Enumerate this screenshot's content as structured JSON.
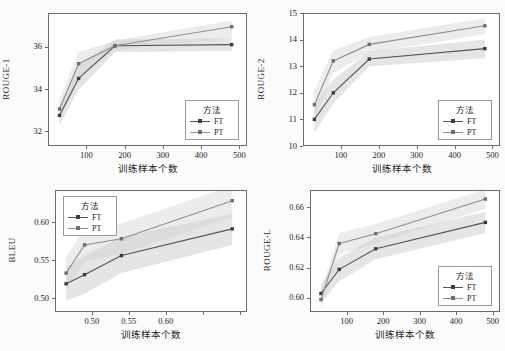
{
  "figure": {
    "background": "#fbfbfb",
    "line_color_ft": "#555555",
    "line_color_pt": "#8f8f8f",
    "band_color": "#cfcfcf",
    "axis_color": "#6b6b6b"
  },
  "legend": {
    "title": "方法",
    "entries": [
      {
        "label": "FT",
        "color": "#555555"
      },
      {
        "label": "PT",
        "color": "#8f8f8f"
      }
    ]
  },
  "chart_data": [
    {
      "id": "rouge1",
      "type": "line",
      "title": "",
      "xlabel": "训练样本个数",
      "ylabel": "ROUGE-1",
      "xlim": [
        0,
        520
      ],
      "ylim": [
        31.3,
        37.6
      ],
      "xticks": [
        100,
        200,
        300,
        400,
        500
      ],
      "yticks": [
        32,
        34,
        36
      ],
      "xticklabels": [
        "100",
        "200",
        "300",
        "400",
        "500"
      ],
      "yticklabels": [
        "32",
        "34",
        "36"
      ],
      "grid": false,
      "legend_position": "lower-right",
      "x": [
        30,
        80,
        175,
        480
      ],
      "series": [
        {
          "name": "FT",
          "values": [
            32.75,
            34.5,
            36.05,
            36.1
          ],
          "band_low": [
            32.3,
            33.95,
            35.75,
            35.8
          ],
          "band_high": [
            33.2,
            35.1,
            36.35,
            36.4
          ]
        },
        {
          "name": "PT",
          "values": [
            33.05,
            35.2,
            36.05,
            36.95
          ],
          "band_low": [
            32.5,
            34.6,
            35.85,
            36.4
          ],
          "band_high": [
            33.5,
            35.75,
            36.3,
            37.25
          ]
        }
      ]
    },
    {
      "id": "rouge2",
      "type": "line",
      "title": "",
      "xlabel": "训练样本个数",
      "ylabel": "ROUGE-2",
      "xlim": [
        0,
        520
      ],
      "ylim": [
        10,
        15
      ],
      "xticks": [
        100,
        200,
        300,
        400,
        500
      ],
      "yticks": [
        10,
        11,
        12,
        13,
        14,
        15
      ],
      "xticklabels": [
        "100",
        "200",
        "300",
        "400",
        "500"
      ],
      "yticklabels": [
        "10",
        "11",
        "12",
        "13",
        "14",
        "15"
      ],
      "grid": false,
      "legend_position": "lower-right",
      "x": [
        30,
        80,
        175,
        480
      ],
      "series": [
        {
          "name": "FT",
          "values": [
            11.0,
            12.0,
            13.27,
            13.66
          ],
          "band_low": [
            10.5,
            11.6,
            13.0,
            13.3
          ],
          "band_high": [
            11.6,
            12.5,
            13.55,
            14.0
          ]
        },
        {
          "name": "PT",
          "values": [
            11.55,
            13.2,
            13.82,
            14.52
          ],
          "band_low": [
            11.0,
            12.75,
            13.5,
            14.2
          ],
          "band_high": [
            12.1,
            13.6,
            14.1,
            14.8
          ]
        }
      ]
    },
    {
      "id": "bleu",
      "type": "line",
      "title": "",
      "xlabel": "训练样本个数",
      "ylabel": "BLEU",
      "xlim": [
        0,
        520
      ],
      "ylim": [
        0.482,
        0.642
      ],
      "xticks": [
        100,
        200,
        300,
        400,
        500
      ],
      "yticks": [
        0.5,
        0.55,
        0.6
      ],
      "xticklabels": [
        "0.50",
        "0.55",
        "0.60"
      ],
      "yticklabels": [
        "0.50",
        "0.55",
        "0.60"
      ],
      "grid": false,
      "legend_position": "upper-left",
      "x": [
        30,
        80,
        180,
        480
      ],
      "series": [
        {
          "name": "FT",
          "values": [
            0.519,
            0.531,
            0.556,
            0.591
          ],
          "band_low": [
            0.497,
            0.506,
            0.533,
            0.57
          ],
          "band_high": [
            0.541,
            0.556,
            0.58,
            0.611
          ]
        },
        {
          "name": "PT",
          "values": [
            0.533,
            0.57,
            0.578,
            0.628
          ],
          "band_low": [
            0.512,
            0.548,
            0.558,
            0.607
          ],
          "band_high": [
            0.554,
            0.592,
            0.598,
            0.648
          ]
        }
      ]
    },
    {
      "id": "rougeL",
      "type": "line",
      "title": "",
      "xlabel": "训练样本个数",
      "ylabel": "ROUGE-L",
      "xlim": [
        0,
        520
      ],
      "ylim": [
        0.5905,
        0.6715
      ],
      "xticks": [
        100,
        200,
        300,
        400,
        500
      ],
      "yticks": [
        0.6,
        0.62,
        0.64,
        0.66
      ],
      "xticklabels": [
        "100",
        "200",
        "300",
        "400",
        "500"
      ],
      "yticklabels": [
        "0.60",
        "0.62",
        "0.64",
        "0.66"
      ],
      "grid": false,
      "legend_position": "lower-right",
      "x": [
        30,
        80,
        180,
        480
      ],
      "series": [
        {
          "name": "FT",
          "values": [
            0.6028,
            0.6188,
            0.6325,
            0.65
          ],
          "band_low": [
            0.5965,
            0.611,
            0.6255,
            0.643
          ],
          "band_high": [
            0.609,
            0.6265,
            0.64,
            0.657
          ]
        },
        {
          "name": "PT",
          "values": [
            0.5988,
            0.636,
            0.6425,
            0.6655
          ],
          "band_low": [
            0.593,
            0.629,
            0.636,
            0.659
          ],
          "band_high": [
            0.605,
            0.643,
            0.649,
            0.672
          ]
        }
      ]
    }
  ]
}
